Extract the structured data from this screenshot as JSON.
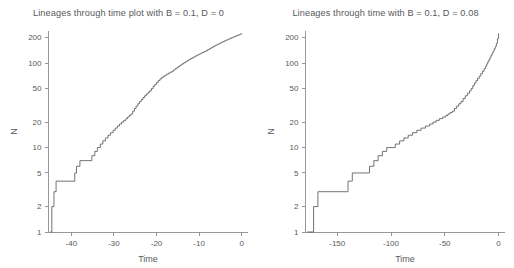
{
  "figure": {
    "width": 514,
    "height": 268,
    "background": "#ffffff",
    "line_color": "#5a5b5d",
    "axis_color": "#8c8d8f",
    "text_color": "#58595b"
  },
  "panels": [
    {
      "id": "left",
      "title": "Lineages through time plot with B = 0.1, D = 0",
      "xlabel": "Time",
      "ylabel": "N"
    },
    {
      "id": "right",
      "title": "Lineages through time with B = 0.1, D = 0.08",
      "xlabel": "Time",
      "ylabel": "N"
    }
  ],
  "chart_data": [
    {
      "type": "line",
      "title": "Lineages through time plot with B = 0.1, D = 0",
      "xlabel": "Time",
      "ylabel": "N",
      "yscale": "log",
      "xlim": [
        -45.5,
        1.5
      ],
      "ylim": [
        1,
        240
      ],
      "xticks": [
        -40,
        -30,
        -20,
        -10,
        0
      ],
      "xticklabels": [
        "-40",
        "-30",
        "-20",
        "-10",
        "0"
      ],
      "yticks": [
        1,
        2,
        5,
        10,
        20,
        50,
        100,
        200
      ],
      "yticklabels": [
        "1",
        "2",
        "5",
        "10",
        "20",
        "50",
        "100",
        "200"
      ],
      "grid": false,
      "legend": false,
      "series": [
        {
          "name": "lineages",
          "step": "post",
          "x": [
            -45.0,
            -44.6,
            -44.1,
            -43.6,
            -39.2,
            -38.8,
            -38.0,
            -36.6,
            -35.2,
            -34.5,
            -33.9,
            -33.2,
            -32.6,
            -32.0,
            -31.4,
            -30.8,
            -30.2,
            -29.7,
            -29.2,
            -28.7,
            -28.2,
            -27.7,
            -27.2,
            -26.8,
            -26.4,
            -26.0,
            -25.6,
            -25.2,
            -24.8,
            -24.4,
            -24.0,
            -23.6,
            -23.2,
            -22.8,
            -22.4,
            -22.0,
            -21.6,
            -21.2,
            -20.8,
            -20.4,
            -20.0,
            -19.6,
            -19.2,
            -18.8,
            -18.4,
            -18.0,
            -17.6,
            -17.2,
            -16.8,
            -16.4,
            -16.0,
            -15.6,
            -15.2,
            -14.8,
            -14.4,
            -14.0,
            -13.6,
            -13.2,
            -12.8,
            -12.4,
            -12.0,
            -11.6,
            -11.2,
            -10.8,
            -10.4,
            -10.0,
            -9.6,
            -9.2,
            -8.8,
            -8.4,
            -8.0,
            -7.6,
            -7.2,
            -6.8,
            -6.4,
            -6.0,
            -5.6,
            -5.2,
            -4.8,
            -4.4,
            -4.0,
            -3.6,
            -3.2,
            -2.8,
            -2.4,
            -2.0,
            -1.6,
            -1.2,
            -0.8,
            -0.4,
            0.0
          ],
          "y": [
            1,
            2,
            3,
            4,
            5,
            6,
            7,
            7,
            8,
            9,
            10,
            11,
            12,
            13,
            14,
            15,
            16,
            17,
            18,
            19,
            20,
            21,
            22,
            23,
            24,
            25,
            27,
            29,
            31,
            33,
            35,
            37,
            39,
            41,
            43,
            45,
            47,
            50,
            53,
            56,
            59,
            62,
            65,
            68,
            70,
            72,
            74,
            76,
            78,
            80,
            83,
            86,
            89,
            92,
            95,
            98,
            101,
            104,
            107,
            110,
            113,
            116,
            119,
            122,
            125,
            128,
            131,
            134,
            137,
            140,
            144,
            148,
            152,
            156,
            160,
            164,
            168,
            172,
            176,
            180,
            184,
            188,
            192,
            196,
            200,
            204,
            208,
            212,
            216,
            220,
            225
          ]
        }
      ]
    },
    {
      "type": "line",
      "title": "Lineages through time with B = 0.1, D = 0.08",
      "xlabel": "Time",
      "ylabel": "N",
      "yscale": "log",
      "xlim": [
        -180,
        6
      ],
      "ylim": [
        1,
        240
      ],
      "xticks": [
        -150,
        -100,
        -50,
        0
      ],
      "xticklabels": [
        "-150",
        "-100",
        "-50",
        "0"
      ],
      "yticks": [
        1,
        2,
        5,
        10,
        20,
        50,
        100,
        200
      ],
      "yticklabels": [
        "1",
        "2",
        "5",
        "10",
        "20",
        "50",
        "100",
        "200"
      ],
      "grid": false,
      "legend": false,
      "series": [
        {
          "name": "lineages",
          "step": "post",
          "x": [
            -178.0,
            -172.0,
            -168.0,
            -140.0,
            -136.0,
            -127.0,
            -120.0,
            -116.0,
            -112.0,
            -108.0,
            -104.0,
            -100.0,
            -96.0,
            -92.0,
            -88.0,
            -84.0,
            -80.0,
            -76.0,
            -72.0,
            -68.0,
            -64.0,
            -61.0,
            -58.0,
            -55.0,
            -52.0,
            -49.0,
            -47.0,
            -45.0,
            -43.0,
            -41.0,
            -39.0,
            -37.0,
            -35.0,
            -33.0,
            -31.0,
            -29.0,
            -27.0,
            -25.5,
            -24.0,
            -22.5,
            -21.0,
            -19.5,
            -18.0,
            -16.5,
            -15.0,
            -13.5,
            -12.0,
            -11.0,
            -10.0,
            -9.0,
            -8.0,
            -7.0,
            -6.0,
            -5.0,
            -4.0,
            -3.0,
            -2.0,
            -1.0,
            0.0
          ],
          "y": [
            1,
            2,
            3,
            4,
            5,
            5,
            6,
            7,
            8,
            9,
            10,
            10,
            11,
            12,
            13,
            14,
            15,
            16,
            17,
            18,
            19,
            20,
            21,
            22,
            23,
            24,
            25,
            26,
            27,
            29,
            31,
            33,
            35,
            38,
            41,
            44,
            47,
            50,
            54,
            58,
            62,
            66,
            70,
            75,
            80,
            86,
            92,
            98,
            104,
            110,
            117,
            124,
            131,
            139,
            148,
            158,
            172,
            195,
            225
          ]
        }
      ]
    }
  ]
}
